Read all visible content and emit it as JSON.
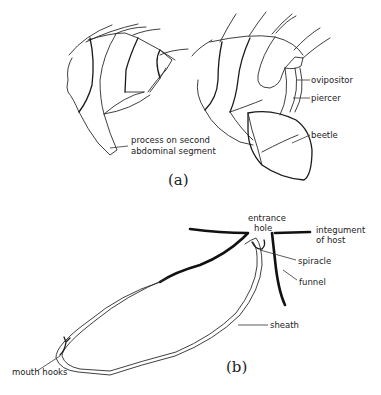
{
  "figure": {
    "panel_a": {
      "caption": "(a)",
      "labels": {
        "process": [
          "process on second",
          "abdominal segment"
        ],
        "ovipositor": "ovipositor",
        "piercer": "piercer",
        "beetle": "beetle"
      }
    },
    "panel_b": {
      "caption": "(b)",
      "labels": {
        "entrance": [
          "entrance",
          "hole"
        ],
        "integument": [
          "integument",
          "of host"
        ],
        "spiracle": "spiracle",
        "funnel": "funnel",
        "sheath": "sheath",
        "mouth_hooks": "mouth hooks"
      }
    }
  }
}
